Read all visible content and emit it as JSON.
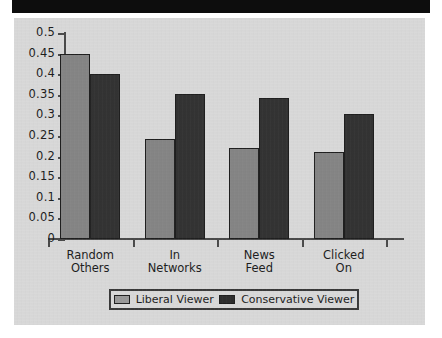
{
  "chart_data": {
    "type": "bar",
    "title": "",
    "xlabel": "",
    "ylabel": "",
    "ylim": [
      0,
      0.5
    ],
    "grid": false,
    "legend_position": "bottom",
    "categories": [
      "Random\nOthers",
      "In\nNetworks",
      "News\nFeed",
      "Clicked\nOn"
    ],
    "ytick_labels": [
      "0.5",
      "0.45",
      "0.4",
      "0.35",
      "0.3",
      "0.25",
      "0.2",
      "0.15",
      "0.1",
      "0.05",
      "0"
    ],
    "ytick_values": [
      0.5,
      0.45,
      0.4,
      0.35,
      0.3,
      0.25,
      0.2,
      0.15,
      0.1,
      0.05,
      0
    ],
    "series": [
      {
        "name": "Liberal Viewer",
        "color": "#858585",
        "values": [
          0.45,
          0.242,
          0.221,
          0.212
        ]
      },
      {
        "name": "Conservative Viewer",
        "color": "#333333",
        "values": [
          0.4,
          0.353,
          0.342,
          0.304
        ]
      }
    ]
  },
  "legend": {
    "entries": [
      {
        "label": "Liberal Viewer"
      },
      {
        "label": "Conservative Viewer"
      }
    ]
  }
}
